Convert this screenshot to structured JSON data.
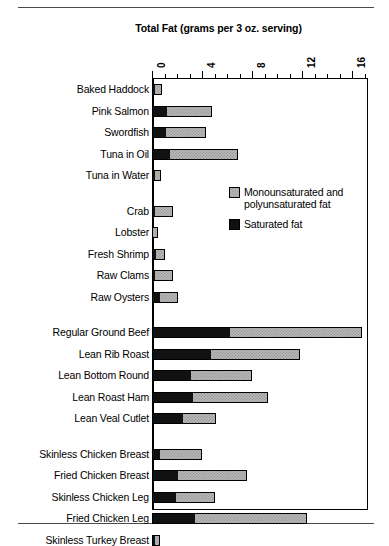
{
  "page": {
    "top_rule": true,
    "bottom_rule": true
  },
  "chart_data": {
    "type": "bar",
    "orientation": "horizontal",
    "stacked": true,
    "title": "Total Fat (grams per 3 oz. serving)",
    "xlabel": "",
    "ylabel": "",
    "xlim": [
      0,
      17.3
    ],
    "xticks": [
      "0",
      "4",
      "8",
      "12",
      "16"
    ],
    "xtick_values": [
      0,
      4,
      8,
      12,
      16
    ],
    "minor_tick_step": 1,
    "grid": false,
    "legend_position": "inside-right",
    "legend": [
      "Monounsaturated and polyunsaturated fat",
      "Saturated fat"
    ],
    "series": [
      {
        "name": "Saturated fat",
        "color": "#111111"
      },
      {
        "name": "Monounsaturated and polyunsaturated fat",
        "color": "#b8b8b8"
      }
    ],
    "groups": [
      {
        "name": "fish",
        "items": [
          {
            "category": "Baked Haddock",
            "saturated": 0.2,
            "unsaturated": 0.6
          },
          {
            "category": "Pink Salmon",
            "saturated": 1.2,
            "unsaturated": 3.6
          },
          {
            "category": "Swordfish",
            "saturated": 1.1,
            "unsaturated": 3.2
          },
          {
            "category": "Tuna in Oil",
            "saturated": 1.4,
            "unsaturated": 5.5
          },
          {
            "category": "Tuna in Water",
            "saturated": 0.2,
            "unsaturated": 0.5
          }
        ]
      },
      {
        "name": "shellfish",
        "items": [
          {
            "category": "Crab",
            "saturated": 0.2,
            "unsaturated": 1.5
          },
          {
            "category": "Lobster",
            "saturated": 0.1,
            "unsaturated": 0.4
          },
          {
            "category": "Fresh Shrimp",
            "saturated": 0.3,
            "unsaturated": 0.7
          },
          {
            "category": "Raw Clams",
            "saturated": 0.2,
            "unsaturated": 1.5
          },
          {
            "category": "Raw Oysters",
            "saturated": 0.6,
            "unsaturated": 1.5
          }
        ]
      },
      {
        "name": "meat",
        "items": [
          {
            "category": "Regular Ground Beef",
            "saturated": 6.2,
            "unsaturated": 10.6
          },
          {
            "category": "Lean Rib Roast",
            "saturated": 4.7,
            "unsaturated": 7.1
          },
          {
            "category": "Lean Bottom Round",
            "saturated": 3.1,
            "unsaturated": 4.9
          },
          {
            "category": "Lean Roast Ham",
            "saturated": 3.3,
            "unsaturated": 6.0
          },
          {
            "category": "Lean Veal Cutlet",
            "saturated": 2.5,
            "unsaturated": 2.6
          }
        ]
      },
      {
        "name": "poultry",
        "items": [
          {
            "category": "Skinless Chicken Breast",
            "saturated": 0.6,
            "unsaturated": 3.4
          },
          {
            "category": "Fried Chicken Breast",
            "saturated": 2.1,
            "unsaturated": 5.5
          },
          {
            "category": "Skinless Chicken Leg",
            "saturated": 1.9,
            "unsaturated": 3.1
          },
          {
            "category": "Fried Chicken Leg",
            "saturated": 3.4,
            "unsaturated": 9.0
          },
          {
            "category": "Skinless Turkey Breast",
            "saturated": 0.2,
            "unsaturated": 0.4
          }
        ]
      }
    ]
  }
}
